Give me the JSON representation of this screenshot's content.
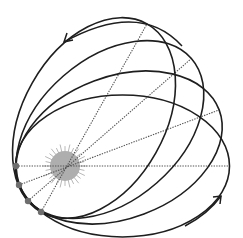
{
  "diagram": {
    "sun": {
      "cx": 65,
      "cy": 166,
      "r": 15,
      "ray_length": 7,
      "ray_count": 28,
      "color": "#aeaeae"
    },
    "orbits": [
      {
        "name": "orbit-1",
        "cx": 122.5,
        "cy": 166,
        "a": 107,
        "b": 71,
        "angle": 0,
        "perihelion": [
          16,
          166
        ],
        "aphelion": [
          229,
          166
        ]
      },
      {
        "name": "orbit-2",
        "cx": 119,
        "cy": 147.5,
        "a": 107,
        "b": 71,
        "angle": -20.6,
        "perihelion": [
          19,
          185
        ],
        "aphelion": [
          219,
          110
        ]
      },
      {
        "name": "orbit-3",
        "cx": 110,
        "cy": 129.5,
        "a": 108,
        "b": 71,
        "angle": -41.1,
        "perihelion": [
          28,
          201
        ],
        "aphelion": [
          192,
          58
        ]
      },
      {
        "name": "orbit-4",
        "cx": 94,
        "cy": 118,
        "a": 108,
        "b": 71,
        "angle": -60.6,
        "perihelion": [
          41,
          212
        ],
        "aphelion": [
          147,
          24
        ]
      }
    ],
    "arrows": [
      {
        "name": "precession-arrow-top",
        "path": "M182,46 Q140,0 64,42",
        "head": [
          64,
          42
        ],
        "head_dir": "down-left"
      },
      {
        "name": "precession-arrow-bottom",
        "path": "M185,226 Q208,214 221,196",
        "head": [
          221,
          196
        ],
        "head_dir": "up-right"
      }
    ],
    "colors": {
      "orbit": "#1e1e1e",
      "axis": "#555555",
      "perihelion_dot": "#6e6e6e",
      "sun": "#aeaeae"
    }
  }
}
